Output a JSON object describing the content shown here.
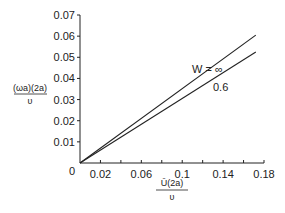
{
  "chart_data": {
    "type": "line",
    "title": "",
    "xlabel": "Ū(2a)/υ",
    "ylabel": "(ωa)(2a)/υ",
    "xlabel_parts": {
      "numerator": "Ū(2a)",
      "denominator": "υ"
    },
    "ylabel_parts": {
      "numerator": "(ωa)(2a)",
      "denominator": "υ"
    },
    "xlim": [
      0,
      0.18
    ],
    "ylim": [
      0,
      0.07
    ],
    "x_ticks": [
      0,
      0.02,
      0.04,
      0.06,
      0.08,
      0.1,
      0.12,
      0.14,
      0.16,
      0.18
    ],
    "x_tick_labels": [
      {
        "value": 0.02,
        "label": "0.02"
      },
      {
        "value": 0.06,
        "label": "0.06"
      },
      {
        "value": 0.1,
        "label": "0.1"
      },
      {
        "value": 0.14,
        "label": "0.14"
      },
      {
        "value": 0.18,
        "label": "0.18"
      }
    ],
    "origin_label": "0",
    "y_ticks": [
      {
        "value": 0.01,
        "label": "0.01"
      },
      {
        "value": 0.02,
        "label": "0.02"
      },
      {
        "value": 0.03,
        "label": "0.03"
      },
      {
        "value": 0.04,
        "label": "0.04"
      },
      {
        "value": 0.05,
        "label": "0.05"
      },
      {
        "value": 0.06,
        "label": "0.06"
      },
      {
        "value": 0.07,
        "label": "0.07"
      }
    ],
    "grid": false,
    "legend": "inline annotations",
    "series": [
      {
        "name": "W = ∞",
        "label": "W = ∞",
        "x": [
          0,
          0.172
        ],
        "y": [
          0,
          0.0605
        ]
      },
      {
        "name": "0.6",
        "label": "0.6",
        "x": [
          0,
          0.172
        ],
        "y": [
          0,
          0.0525
        ]
      }
    ]
  }
}
